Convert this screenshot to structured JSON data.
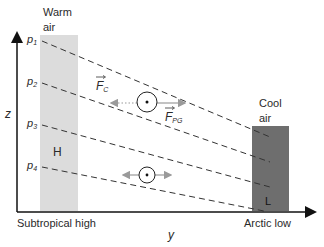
{
  "diagram": {
    "labels": {
      "warm_air_1": "Warm",
      "warm_air_2": "air",
      "cool_air_1": "Cool",
      "cool_air_2": "air",
      "high": "H",
      "low": "L",
      "subtropical_high": "Subtropical high",
      "arctic_low": "Arctic low",
      "z_axis": "z",
      "y_axis": "y",
      "p1": "p",
      "p1_sub": "1",
      "p2": "p",
      "p2_sub": "2",
      "p3": "p",
      "p3_sub": "3",
      "p4": "p",
      "p4_sub": "4",
      "fc": "F",
      "fc_sub": "C",
      "fpg": "F",
      "fpg_sub": "PG"
    },
    "colors": {
      "warm_column": "#dcdcdc",
      "cool_column": "#6e6e6e",
      "axis": "#111111",
      "dash": "#333333",
      "arrow_gray": "#9a9a9a"
    }
  }
}
